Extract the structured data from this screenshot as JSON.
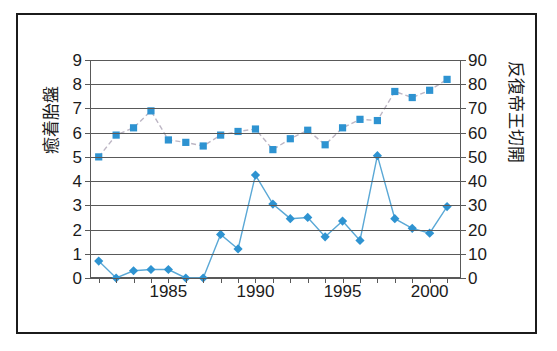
{
  "chart_data": {
    "type": "line",
    "title": "",
    "xlabel": "",
    "x": [
      1981,
      1982,
      1983,
      1984,
      1985,
      1986,
      1987,
      1988,
      1989,
      1990,
      1991,
      1992,
      1993,
      1994,
      1995,
      1996,
      1997,
      1998,
      1999,
      2000,
      2001
    ],
    "xtick_labels": [
      "1985",
      "1990",
      "1995",
      "2000"
    ],
    "xtick_values": [
      1985,
      1990,
      1995,
      2000
    ],
    "xlim": [
      1980.5,
      2001.8
    ],
    "grid": true,
    "legend_position": "none",
    "axes": [
      {
        "id": "left",
        "label": "癒着胎盤",
        "ylim": [
          0,
          9
        ],
        "ticks": [
          0,
          1,
          2,
          3,
          4,
          5,
          6,
          7,
          8,
          9
        ],
        "tick_labels": [
          "0",
          "1",
          "2",
          "3",
          "4",
          "5",
          "6",
          "7",
          "8",
          "9"
        ]
      },
      {
        "id": "right",
        "label": "反復帝王切開",
        "ylim": [
          0,
          90
        ],
        "ticks": [
          0,
          10,
          20,
          30,
          40,
          50,
          60,
          70,
          80,
          90
        ],
        "tick_labels": [
          "0",
          "10",
          "20",
          "30",
          "40",
          "50",
          "60",
          "70",
          "80",
          "90"
        ]
      }
    ],
    "series": [
      {
        "name": "反復帝王切開",
        "axis": "right",
        "marker": "square",
        "linestyle": "dashed",
        "color": "#2e93d1",
        "values": [
          50,
          59,
          62,
          69,
          57,
          56,
          54.5,
          59,
          60.5,
          61.5,
          53,
          57.5,
          61,
          55,
          62,
          65.5,
          65,
          77,
          74.5,
          77.5,
          82
        ]
      },
      {
        "name": "癒着胎盤",
        "axis": "left",
        "marker": "diamond",
        "linestyle": "solid",
        "color": "#2e93d1",
        "values": [
          0.7,
          0.0,
          0.3,
          0.35,
          0.35,
          0.0,
          0.0,
          1.8,
          1.2,
          4.25,
          3.05,
          2.45,
          2.5,
          1.7,
          2.35,
          1.55,
          5.05,
          2.45,
          2.05,
          1.85,
          2.95
        ]
      }
    ]
  }
}
